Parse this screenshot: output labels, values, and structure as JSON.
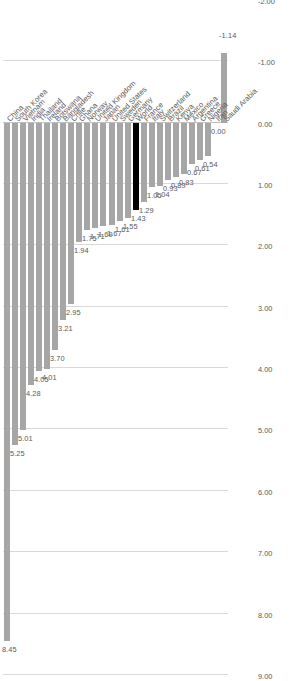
{
  "chart_data": {
    "type": "bar",
    "orientation": "vertical-rotated",
    "title": "",
    "subtitle": "",
    "xlabel": "",
    "ylabel": "",
    "ylim": [
      -2.0,
      9.0
    ],
    "y_ticks": [
      "9.00",
      "8.00",
      "7.00",
      "6.00",
      "5.00",
      "4.00",
      "3.00",
      "2.00",
      "1.00",
      "0.00",
      "-1.00",
      "-2.00"
    ],
    "grid": true,
    "legend": "none",
    "bar_color": "#a6a6a6",
    "highlight_color": "#000000",
    "highlight_category": "World",
    "data_labels": true,
    "categories": [
      "China",
      "South Korea",
      "Vietnam",
      "India",
      "Thailand",
      "Ireland",
      "Botswana",
      "Bangladesh",
      "Chile",
      "Ghana",
      "Norway",
      "United Kingdom",
      "Japan",
      "United States",
      "Sweden",
      "Germany",
      "World",
      "France",
      "Italy",
      "Switzerland",
      "Brazil",
      "Kenya",
      "Mexico",
      "Argentina",
      "Greece",
      "Nigeria",
      "Iran",
      "Saudi Arabia"
    ],
    "values": [
      8.45,
      5.25,
      5.01,
      4.28,
      4.05,
      4.01,
      3.7,
      3.21,
      2.95,
      1.94,
      1.75,
      1.71,
      1.69,
      1.67,
      1.61,
      1.55,
      1.43,
      1.29,
      1.05,
      1.04,
      0.93,
      0.89,
      0.83,
      0.67,
      0.61,
      0.54,
      0.0,
      -1.14
    ],
    "value_labels": [
      "8.45",
      "5.25",
      "5.01",
      "4.28",
      "4.05",
      "4.01",
      "3.70",
      "3.21",
      "2.95",
      "1.94",
      "1.75",
      "1.71",
      "1.69",
      "1.67",
      "1.61",
      "1.55",
      "1.43",
      "1.29",
      "1.05",
      "1.04",
      "0.93",
      "0.89",
      "0.83",
      "0.67",
      "0.61",
      "0.54",
      "0.00",
      "-1.14"
    ]
  }
}
